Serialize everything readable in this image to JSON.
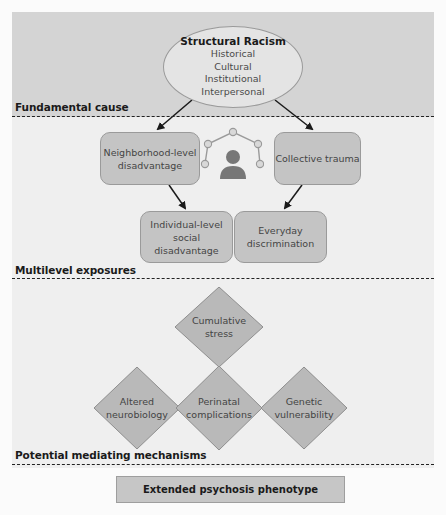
{
  "sections": {
    "fundamental_cause": "Fundamental cause",
    "multilevel_exposures": "Multilevel exposures",
    "mediating_mechanisms": "Potential mediating mechanisms"
  },
  "root": {
    "title": "Structural Racism",
    "items": [
      "Historical",
      "Cultural",
      "Institutional",
      "Interpersonal"
    ]
  },
  "exposures": {
    "neighborhood": "Neighborhood-level disadvantage",
    "neighborhood_line1": "Neighborhood-level",
    "neighborhood_line2": "disadvantage",
    "collective": "Collective trauma",
    "individual_line1": "Individual-level",
    "individual_line2": "social disadvantage",
    "everyday_line1": "Everyday",
    "everyday_line2": "discrimination"
  },
  "center_icon": "person-network-icon",
  "mechanisms": {
    "cumulative_line1": "Cumulative",
    "cumulative_line2": "stress",
    "altered_line1": "Altered",
    "altered_line2": "neurobiology",
    "perinatal_line1": "Perinatal",
    "perinatal_line2": "complications",
    "genetic_line1": "Genetic",
    "genetic_line2": "vulnerability"
  },
  "outcome": "Extended psychosis phenotype",
  "colors": {
    "top_panel": "#d4d4d4",
    "mid_panel": "#efefef",
    "node_fill": "#c4c4c4",
    "node_border": "#9a9a9a",
    "arrow": "#1a1a1a"
  }
}
